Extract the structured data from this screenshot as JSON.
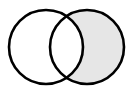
{
  "diagram": {
    "type": "venn",
    "sets": [
      {
        "name": "A",
        "cx": 46,
        "cy": 47,
        "r": 37,
        "label": ""
      },
      {
        "name": "B",
        "cx": 87,
        "cy": 47,
        "r": 37,
        "label": ""
      }
    ],
    "shaded_region": "B minus A",
    "colors": {
      "stroke": "#000000",
      "shade": "#e6e6e6",
      "background": "#ffffff"
    },
    "stroke_width": 2.6
  }
}
